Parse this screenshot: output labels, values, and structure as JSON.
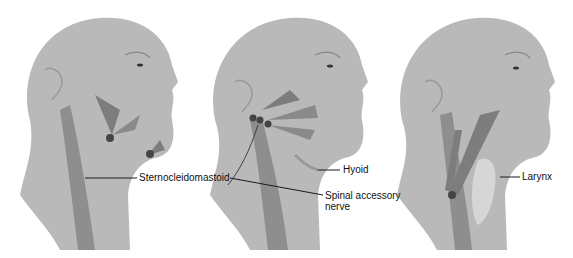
{
  "figure": {
    "panels": [
      {
        "id": "left",
        "labels": [
          {
            "text": "Sternocleidomastoid"
          }
        ]
      },
      {
        "id": "middle",
        "labels": [
          {
            "text": "Hyoid"
          },
          {
            "text": "Spinal accessory"
          },
          {
            "text": "nerve"
          }
        ]
      },
      {
        "id": "right",
        "labels": [
          {
            "text": "Larynx"
          }
        ]
      }
    ],
    "colors": {
      "skin": "#b9b9b9",
      "skin_dark": "#a4a4a4",
      "muscle": "#7d7d7d",
      "muscle_light": "#9a9a9a",
      "line": "#1a1a1a"
    }
  }
}
